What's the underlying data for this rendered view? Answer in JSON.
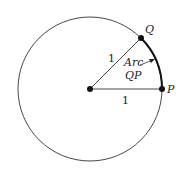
{
  "diagram": {
    "points": {
      "center": {
        "label": "",
        "x": 90,
        "y": 89
      },
      "P": {
        "label": "P",
        "x": 162,
        "y": 89
      },
      "Q": {
        "label": "Q",
        "x": 141,
        "y": 38
      }
    },
    "radius_labels": {
      "OQ": "1",
      "OP": "1"
    },
    "arc_label_line1": "Arc",
    "arc_label_line2": "QP",
    "colors": {
      "stroke": "#222222",
      "background": "#ffffff"
    }
  }
}
